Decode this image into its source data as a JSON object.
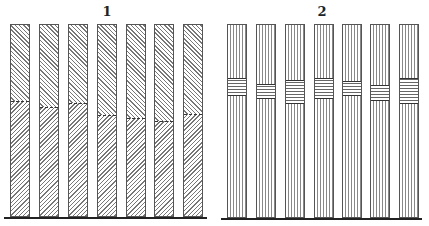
{
  "panels": [
    {
      "label": "1",
      "label_x": 107,
      "baseline": {
        "x1": 4,
        "x2": 207,
        "y": 217
      },
      "pattern_top": "hatch-a",
      "pattern_bottom": "hatch-b",
      "bars": [
        {
          "x": 10,
          "divider_y": 100
        },
        {
          "x": 39,
          "divider_y": 106
        },
        {
          "x": 68,
          "divider_y": 102
        },
        {
          "x": 97,
          "divider_y": 114
        },
        {
          "x": 126,
          "divider_y": 117
        },
        {
          "x": 154,
          "divider_y": 120
        },
        {
          "x": 183,
          "divider_y": 113
        }
      ]
    },
    {
      "label": "2",
      "label_x": 322,
      "baseline": {
        "x1": 221,
        "x2": 422,
        "y": 218
      },
      "bars": [
        {
          "x": 227,
          "band_top": 77,
          "band_bottom": 95
        },
        {
          "x": 256,
          "band_top": 83,
          "band_bottom": 98
        },
        {
          "x": 285,
          "band_top": 79,
          "band_bottom": 103
        },
        {
          "x": 314,
          "band_top": 77,
          "band_bottom": 98
        },
        {
          "x": 342,
          "band_top": 80,
          "band_bottom": 95
        },
        {
          "x": 370,
          "band_top": 84,
          "band_bottom": 100
        },
        {
          "x": 399,
          "band_top": 77,
          "band_bottom": 103
        }
      ]
    }
  ],
  "bar_geometry": {
    "top": 24,
    "width": 20
  }
}
